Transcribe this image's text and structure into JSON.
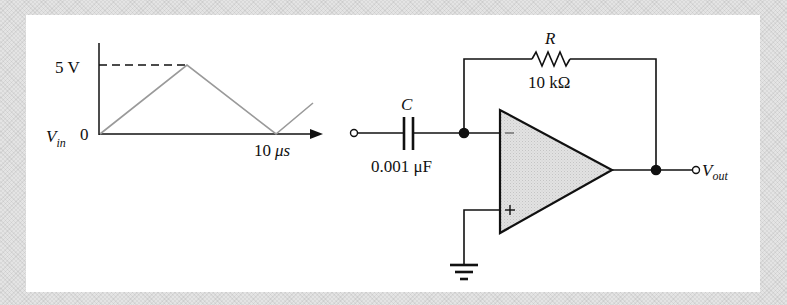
{
  "waveform": {
    "y_max_label": "5 V",
    "y_zero_label": "0",
    "signal_label": "V",
    "signal_subscript": "in",
    "x_end_label_num": "10",
    "x_end_label_unit": "μs",
    "shape": "triangle",
    "peak_voltage_v": 5,
    "period_us": 10
  },
  "circuit": {
    "type": "op-amp differentiator",
    "capacitor": {
      "name": "C",
      "value": "0.001 μF"
    },
    "resistor": {
      "name": "R",
      "value": "10 kΩ"
    },
    "opamp": {
      "inverting_label": "−",
      "noninverting_label": "+"
    },
    "output": {
      "label": "V",
      "subscript": "out"
    }
  },
  "colors": {
    "line": "#111111",
    "waveform_trace": "#9a9a9a",
    "opamp_fill": "#d9d9d9",
    "panel": "#ffffff",
    "background": "#e4e4e4"
  }
}
